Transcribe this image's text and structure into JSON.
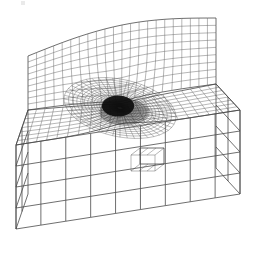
{
  "figure": {
    "kind": "finite-element-mesh",
    "canvas": {
      "width": 268,
      "height": 253,
      "background": "#ffffff"
    },
    "line_color": "#4a4a4a",
    "dense_color": "#0d0d0d",
    "line_width_coarse": 0.8,
    "line_width_fine": 0.45,
    "scan_artifact": {
      "x": 21,
      "y": 1,
      "width": 4,
      "height": 4,
      "color": "#d8d8d8"
    }
  },
  "projection": {
    "type": "oblique-axonometric",
    "depth_dx": -46,
    "depth_dy": 36,
    "note": "front-right faces toward viewer, depth recedes down-left"
  },
  "components": [
    {
      "name": "vertical-web-plate",
      "label": "Vertical web plate (upper)",
      "mesh": "structured-quad-with-radial-refinement"
    },
    {
      "name": "horizontal-flange-top",
      "label": "Flange top surface",
      "mesh": "structured-quad-with-radial-refinement"
    },
    {
      "name": "flange-front-face",
      "label": "Flange front vertical face",
      "mesh": "coarse-quad"
    },
    {
      "name": "flange-left-end-cap",
      "label": "Flange left end cap",
      "mesh": "coarse-quad"
    },
    {
      "name": "flange-right-end-cap",
      "label": "Flange right end cap",
      "mesh": "coarse-quad"
    },
    {
      "name": "crack-tip-singularity",
      "label": "Refined crack-tip / hot-spot region",
      "mesh": "dense-radial-rosette"
    },
    {
      "name": "weld-notch-detail",
      "label": "Small weld-toe notch cutout",
      "mesh": "fine-quad"
    }
  ],
  "geometry": {
    "web": {
      "front_top_left": [
        28,
        56
      ],
      "front_top_right": [
        216,
        18
      ],
      "front_bot_left": [
        28,
        110
      ],
      "front_bot_right": [
        216,
        84
      ],
      "top_curve_sag": -12,
      "cols": 22,
      "rows": 9
    },
    "flange_top": {
      "back_left": [
        28,
        110
      ],
      "back_right": [
        216,
        84
      ],
      "front_left": [
        16,
        145
      ],
      "front_right": [
        240,
        110
      ],
      "cols": 22,
      "rows": 8,
      "depth_dx": -14,
      "depth_dy": 36
    },
    "flange_front": {
      "top_left": [
        16,
        145
      ],
      "top_right": [
        240,
        110
      ],
      "height": 84,
      "cols": 9,
      "rows": 4
    },
    "left_cap": {
      "near_top": [
        16,
        145
      ],
      "far_top": [
        28,
        110
      ],
      "height": 84,
      "rows": 4
    },
    "right_cap": {
      "near_top": [
        240,
        110
      ],
      "far_top": [
        216,
        84
      ],
      "height": 84,
      "rows": 4
    },
    "hotspot": {
      "center": [
        120,
        108
      ],
      "inner_radius": 3,
      "outer_radius": 56,
      "radial_rings": 26,
      "angular_divisions": 48,
      "dark_core_rx": 26,
      "dark_core_ry": 17
    },
    "notch": {
      "x": 140,
      "y": 148,
      "width": 24,
      "height": 16
    }
  },
  "chart_data": {
    "type": "diagram",
    "elements_visible_estimate": 2400,
    "refinement_levels": 7,
    "annotations": []
  }
}
